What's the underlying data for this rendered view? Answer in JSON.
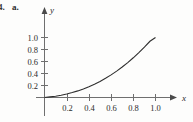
{
  "exercise": {
    "item_number": "4.",
    "part_label": "a."
  },
  "chart_data": {
    "type": "line",
    "title": "",
    "subtitle": "",
    "xlabel": "x",
    "ylabel": "y",
    "xlim": [
      0,
      1.12
    ],
    "ylim": [
      0,
      1.1
    ],
    "grid": false,
    "legend": null,
    "annotations": [],
    "xticks": [
      0.2,
      0.4,
      0.6,
      0.8,
      1.0
    ],
    "xtick_labels": [
      "0.2",
      "0.4",
      "0.6",
      "0.8",
      "1.0"
    ],
    "yticks": [
      0.2,
      0.4,
      0.6,
      0.8,
      1.0
    ],
    "ytick_labels": [
      "0.2",
      "0.4",
      "0.6",
      "0.8",
      "1.0"
    ],
    "series": [
      {
        "name": "curve",
        "color": "#2e2e2e",
        "x": [
          0.0,
          0.05,
          0.1,
          0.15,
          0.2,
          0.25,
          0.3,
          0.35,
          0.4,
          0.45,
          0.5,
          0.55,
          0.6,
          0.65,
          0.7,
          0.75,
          0.8,
          0.85,
          0.9,
          0.95,
          1.0
        ],
        "y": [
          0.0,
          0.01,
          0.022,
          0.038,
          0.058,
          0.082,
          0.11,
          0.143,
          0.18,
          0.222,
          0.268,
          0.32,
          0.377,
          0.44,
          0.508,
          0.582,
          0.662,
          0.748,
          0.84,
          0.937,
          1.0
        ]
      }
    ]
  },
  "axes": {
    "x_arrow": "arrow-right",
    "y_arrow": "arrow-up"
  }
}
